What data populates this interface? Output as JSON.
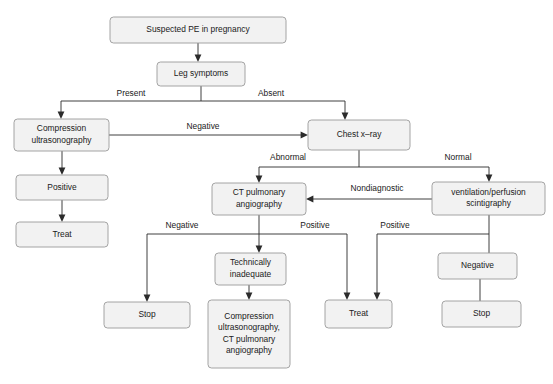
{
  "diagram": {
    "colors": {
      "node_fill": "#f2f2f2",
      "node_stroke": "#9a9a9a",
      "edge_stroke": "#2b2b2b",
      "text": "#1a1a1a",
      "background": "#ffffff"
    },
    "nodes": [
      {
        "id": "suspected_pe",
        "label": "Suspected PE in pregnancy",
        "lines": [
          "Suspected PE in pregnancy"
        ],
        "x": 110,
        "y": 17,
        "w": 176,
        "h": 26
      },
      {
        "id": "leg_symptoms",
        "label": "Leg symptoms",
        "lines": [
          "Leg symptoms"
        ],
        "x": 157,
        "y": 62,
        "w": 88,
        "h": 24
      },
      {
        "id": "compression_us",
        "label": "Compression ultrasonography",
        "lines": [
          "Compression",
          "ultrasonography"
        ],
        "x": 14,
        "y": 119,
        "w": 95,
        "h": 32
      },
      {
        "id": "chest_xray",
        "label": "Chest x-ray",
        "lines": [
          "Chest x–ray"
        ],
        "x": 308,
        "y": 120,
        "w": 102,
        "h": 30
      },
      {
        "id": "positive_us",
        "label": "Positive",
        "lines": [
          "Positive"
        ],
        "x": 16,
        "y": 175,
        "w": 92,
        "h": 25
      },
      {
        "id": "ct_pulm_ang",
        "label": "CT pulmonary angiography",
        "lines": [
          "CT pulmonary",
          "angiography"
        ],
        "x": 212,
        "y": 183,
        "w": 94,
        "h": 32
      },
      {
        "id": "vq_scintigraphy",
        "label": "ventilation/perfusion scintigraphy",
        "lines": [
          "ventilation/perfusion",
          "scintigraphy"
        ],
        "x": 432,
        "y": 182,
        "w": 113,
        "h": 33
      },
      {
        "id": "treat_us",
        "label": "Treat",
        "lines": [
          "Treat"
        ],
        "x": 16,
        "y": 222,
        "w": 92,
        "h": 25
      },
      {
        "id": "technically_inadeq",
        "label": "Technically inadequate",
        "lines": [
          "Technically",
          "inadequate"
        ],
        "x": 215,
        "y": 253,
        "w": 71,
        "h": 32
      },
      {
        "id": "negative_vq",
        "label": "Negative",
        "lines": [
          "Negative"
        ],
        "x": 438,
        "y": 253,
        "w": 79,
        "h": 26
      },
      {
        "id": "stop_ct",
        "label": "Stop",
        "lines": [
          "Stop"
        ],
        "x": 104,
        "y": 302,
        "w": 86,
        "h": 26
      },
      {
        "id": "repeat_imaging",
        "label": "Compression ultrasonography, CT pulmonary angiography",
        "lines": [
          "Compression",
          "ultrasonography,",
          "CT pulmonary",
          "angiography"
        ],
        "x": 208,
        "y": 300,
        "w": 82,
        "h": 68
      },
      {
        "id": "treat_ct",
        "label": "Treat",
        "lines": [
          "Treat"
        ],
        "x": 325,
        "y": 300,
        "w": 67,
        "h": 28
      },
      {
        "id": "stop_vq",
        "label": "Stop",
        "lines": [
          "Stop"
        ],
        "x": 442,
        "y": 301,
        "w": 79,
        "h": 26
      }
    ],
    "edge_labels": [
      {
        "id": "present",
        "text": "Present",
        "x": 131,
        "y": 94
      },
      {
        "id": "absent",
        "text": "Absent",
        "x": 271,
        "y": 94
      },
      {
        "id": "negative_us",
        "text": "Negative",
        "x": 203,
        "y": 127
      },
      {
        "id": "abnormal",
        "text": "Abnormal",
        "x": 288,
        "y": 158
      },
      {
        "id": "normal",
        "text": "Normal",
        "x": 458,
        "y": 158
      },
      {
        "id": "nondiagnostic",
        "text": "Nondiagnostic",
        "x": 377,
        "y": 189
      },
      {
        "id": "negative_ct",
        "text": "Negative",
        "x": 182,
        "y": 226
      },
      {
        "id": "positive_ct",
        "text": "Positive",
        "x": 315,
        "y": 226
      },
      {
        "id": "positive_vq",
        "text": "Positive",
        "x": 395,
        "y": 226
      }
    ]
  }
}
